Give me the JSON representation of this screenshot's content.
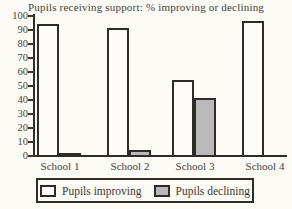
{
  "chart_data": {
    "type": "bar",
    "title": "Pupils receiving support: % improving or declining",
    "categories": [
      "School 1",
      "School 2",
      "School 3",
      "School 4"
    ],
    "series": [
      {
        "name": "Pupils improving",
        "values": [
          95,
          92,
          55,
          97
        ],
        "color": "#fdfcf8"
      },
      {
        "name": "Pupils declining",
        "values": [
          3,
          5,
          42,
          0
        ],
        "color": "#b9b9b9"
      }
    ],
    "ylim": [
      0,
      100
    ],
    "yticks": [
      0,
      10,
      20,
      30,
      40,
      50,
      60,
      70,
      80,
      90,
      100
    ],
    "xlabel": "",
    "ylabel": "",
    "grid": false,
    "legend_position": "bottom"
  },
  "colors": {
    "background": "#fbfaf5",
    "axis": "#2e2c28",
    "bar_outline": "#2e2c28",
    "improving_fill": "#fdfcf8",
    "declining_fill": "#b9b9b9",
    "text": "#45413b"
  }
}
